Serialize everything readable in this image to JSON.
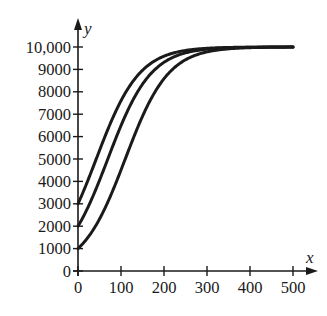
{
  "chart_data": {
    "type": "line",
    "title": "",
    "xlabel": "x",
    "ylabel": "y",
    "xlim": [
      0,
      500
    ],
    "ylim": [
      0,
      10000
    ],
    "grid": false,
    "legend": null,
    "x_ticks": [
      0,
      100,
      200,
      300,
      400,
      500
    ],
    "x_tick_labels": [
      "0",
      "100",
      "200",
      "300",
      "400",
      "500"
    ],
    "y_ticks": [
      0,
      1000,
      2000,
      3000,
      4000,
      5000,
      6000,
      7000,
      8000,
      9000,
      10000
    ],
    "y_tick_labels": [
      "0",
      "1000",
      "2000",
      "3000",
      "4000",
      "5000",
      "6000",
      "7000",
      "8000",
      "9000",
      "10,000"
    ],
    "model": "logistic y = K / (1 + ((K - y0)/y0) * exp(-k x)), K = 10000, k ≈ 0.02",
    "series": [
      {
        "name": "y0 = 3000",
        "initial_value": 3000,
        "x": [
          0,
          25,
          50,
          75,
          100,
          150,
          200,
          250,
          300,
          400,
          500
        ],
        "values": [
          3000,
          4140,
          5380,
          6580,
          7600,
          9000,
          9630,
          9860,
          9950,
          9990,
          10000
        ]
      },
      {
        "name": "y0 = 2000",
        "initial_value": 2000,
        "x": [
          0,
          25,
          50,
          75,
          100,
          150,
          200,
          250,
          300,
          400,
          500
        ],
        "values": [
          2000,
          2920,
          4050,
          5280,
          6490,
          8340,
          9320,
          9740,
          9900,
          9990,
          10000
        ]
      },
      {
        "name": "y0 = 1000",
        "initial_value": 1000,
        "x": [
          0,
          25,
          50,
          75,
          100,
          150,
          200,
          250,
          300,
          400,
          500
        ],
        "values": [
          1000,
          1550,
          2320,
          3310,
          4510,
          6910,
          8590,
          9430,
          9780,
          9970,
          10000
        ]
      }
    ]
  }
}
